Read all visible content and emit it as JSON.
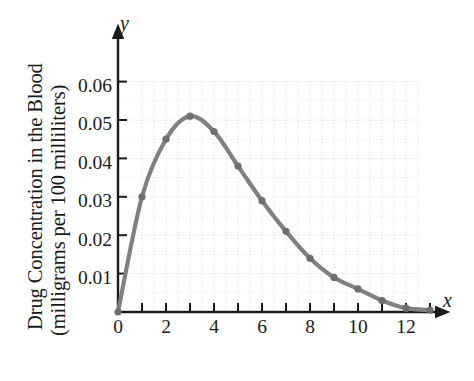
{
  "chart_data": {
    "type": "line",
    "title": "",
    "xlabel": "Time (hours)",
    "ylabel_line1": "Drug Concentration in the Blood",
    "ylabel_line2": "(milligrams per 100 milliliters)",
    "x_axis_letter": "x",
    "y_axis_letter": "y",
    "xlim": [
      0,
      13.6
    ],
    "ylim": [
      0,
      0.065
    ],
    "grid": true,
    "grid_style": "dotted",
    "legend": "none",
    "series_color": "#808080",
    "marker": "circle",
    "x": [
      0,
      1,
      2,
      3,
      4,
      5,
      6,
      7,
      8,
      9,
      10,
      11,
      12,
      13
    ],
    "values": [
      0,
      0.03,
      0.045,
      0.051,
      0.047,
      0.038,
      0.029,
      0.021,
      0.014,
      0.009,
      0.006,
      0.003,
      0.001,
      0.0005
    ],
    "x_ticks_major": [
      0,
      2,
      4,
      6,
      8,
      10,
      12
    ],
    "x_tick_labels": [
      "0",
      "2",
      "4",
      "6",
      "8",
      "10",
      "12"
    ],
    "x_ticks_all": [
      0,
      1,
      2,
      3,
      4,
      5,
      6,
      7,
      8,
      9,
      10,
      11,
      12,
      13
    ],
    "y_ticks": [
      0.01,
      0.02,
      0.03,
      0.04,
      0.05,
      0.06
    ],
    "y_tick_labels": [
      "0.01",
      "0.02",
      "0.03",
      "0.04",
      "0.05",
      "0.06"
    ]
  }
}
